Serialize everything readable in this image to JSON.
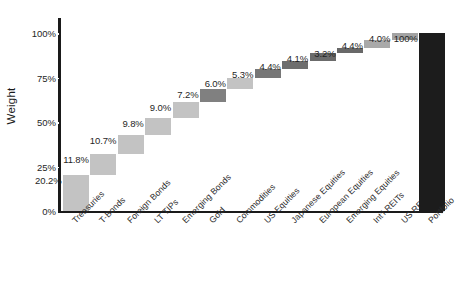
{
  "chart_data": {
    "type": "bar",
    "title": "",
    "subtitle": "",
    "xlabel": "",
    "ylabel": "Weight",
    "ylim": [
      0,
      100
    ],
    "yticks": [
      "0%",
      "25%",
      "50%",
      "75%",
      "100%"
    ],
    "grid": false,
    "legend": "none",
    "waterfall": true,
    "categories": [
      "Treasuries",
      "T-Bonds",
      "Foreign Bonds",
      "LT TIPs",
      "Emerging Bonds",
      "Gold",
      "Commodities",
      "US Equities",
      "Japanese Equities",
      "European Equities",
      "Emerging Equities",
      "Int'l REITs",
      "US REITs",
      "Portfolio"
    ],
    "values": [
      20.2,
      11.8,
      10.7,
      9.8,
      9.0,
      7.2,
      6.0,
      5.3,
      4.4,
      4.1,
      3.2,
      4.4,
      4.0,
      100
    ],
    "data_labels": [
      "20.2%",
      "11.8%",
      "10.7%",
      "9.8%",
      "9.0%",
      "7.2%",
      "6.0%",
      "5.3%",
      "4.4%",
      "4.1%",
      "3.2%",
      "4.4%",
      "4.0%",
      "100%"
    ],
    "cumulative_base": [
      0.0,
      20.2,
      32.0,
      42.7,
      52.5,
      61.5,
      68.7,
      74.7,
      80.0,
      84.4,
      88.5,
      91.7,
      96.1,
      0.0
    ],
    "bar_colors": [
      "#c3c3c3",
      "#c3c3c3",
      "#c3c3c3",
      "#c3c3c3",
      "#c3c3c3",
      "#808080",
      "#c3c3c3",
      "#777777",
      "#6e6e6e",
      "#6b6b6b",
      "#686868",
      "#a9a9a9",
      "#a3a3a3",
      "#1c1c1c"
    ]
  },
  "colors": {
    "axis": "#1a1a1a",
    "text": "#262626",
    "background": "#ffffff",
    "light_bar": "#c3c3c3",
    "dark_bar": "#6e6e6e",
    "total_bar": "#1c1c1c"
  }
}
